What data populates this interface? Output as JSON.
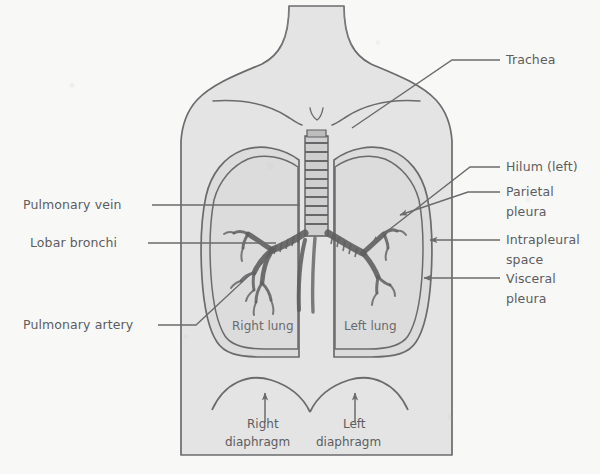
{
  "figure": {
    "background_color": "#f8f8f7",
    "body_fill": "#e4e4e4",
    "lung_fill": "#dcdcdc",
    "ink_color": "#6b6b6d",
    "label_color": "#5d5d5f"
  },
  "callout_labels": {
    "trachea": "Trachea",
    "hilum_left": "Hilum (left)",
    "parietal_pleura_line1": "Parietal",
    "parietal_pleura_line2": "pleura",
    "intrapleural_space_line1": "Intrapleural",
    "intrapleural_space_line2": "space",
    "visceral_pleura_line1": "Visceral",
    "visceral_pleura_line2": "pleura",
    "pulmonary_vein": "Pulmonary vein",
    "lobar_bronchi": "Lobar bronchi",
    "pulmonary_artery": "Pulmonary artery"
  },
  "inner_labels": {
    "right_lung": "Right lung",
    "left_lung": "Left lung"
  },
  "diaphragm_labels": {
    "right_line1": "Right",
    "right_line2": "diaphragm",
    "left_line1": "Left",
    "left_line2": "diaphragm"
  },
  "structures": [
    {
      "name": "trachea",
      "description": "ribbed cartilaginous airway descending in midline"
    },
    {
      "name": "right-main-bronchus",
      "description": "branches right with lobar bronchi"
    },
    {
      "name": "left-main-bronchus",
      "description": "branches left with lobar bronchi"
    },
    {
      "name": "right-lung",
      "description": "right lung field outlined by pleura"
    },
    {
      "name": "left-lung",
      "description": "left lung field outlined by pleura"
    },
    {
      "name": "parietal-pleura",
      "description": "outer pleural layer lining chest wall"
    },
    {
      "name": "visceral-pleura",
      "description": "inner pleural layer on lung surface"
    },
    {
      "name": "intrapleural-space",
      "description": "potential space between pleural layers"
    },
    {
      "name": "right-diaphragm",
      "description": "right hemidiaphragm dome"
    },
    {
      "name": "left-diaphragm",
      "description": "left hemidiaphragm dome"
    },
    {
      "name": "torso",
      "description": "head, neck, shoulders and chest outline"
    }
  ]
}
